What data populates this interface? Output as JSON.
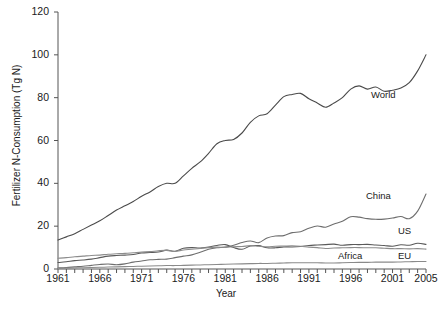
{
  "chart_data": {
    "type": "line",
    "title": "",
    "xlabel": "Year",
    "ylabel": "Fertilizer N-Consumption (Tg N)",
    "xlim": [
      1961,
      2005
    ],
    "ylim": [
      0,
      120
    ],
    "yticks": [
      0,
      20,
      40,
      60,
      80,
      100,
      120
    ],
    "xticks": [
      1961,
      1966,
      1971,
      1976,
      1981,
      1986,
      1991,
      1996,
      2001,
      2005
    ],
    "xtick_labels": [
      "1961",
      "1966",
      "1971",
      "1976",
      "1981",
      "1986",
      "1991",
      "1996",
      "2001",
      "2005"
    ],
    "ytick_labels": [
      "0",
      "20",
      "40",
      "60",
      "80",
      "100",
      "120"
    ],
    "grid": false,
    "legend": "inline-annotations",
    "x": [
      1961,
      1962,
      1963,
      1964,
      1965,
      1966,
      1967,
      1968,
      1969,
      1970,
      1971,
      1972,
      1973,
      1974,
      1975,
      1976,
      1977,
      1978,
      1979,
      1980,
      1981,
      1982,
      1983,
      1984,
      1985,
      1986,
      1987,
      1988,
      1989,
      1990,
      1991,
      1992,
      1993,
      1994,
      1995,
      1996,
      1997,
      1998,
      1999,
      2000,
      2001,
      2002,
      2003,
      2004,
      2005
    ],
    "series": [
      {
        "name": "World",
        "color": "#4a4a4a",
        "values": [
          13.5,
          15.0,
          16.5,
          18.5,
          20.5,
          22.5,
          25.0,
          27.5,
          29.5,
          31.5,
          34.0,
          36.0,
          38.5,
          40.0,
          40.0,
          43.5,
          47.0,
          50.0,
          54.0,
          58.5,
          60.0,
          60.5,
          63.5,
          68.5,
          71.5,
          72.5,
          76.5,
          80.5,
          81.5,
          82.0,
          79.5,
          77.5,
          75.5,
          77.5,
          80.0,
          84.0,
          85.5,
          84.0,
          85.0,
          83.0,
          83.5,
          84.5,
          87.0,
          92.5,
          100.0
        ]
      },
      {
        "name": "China",
        "color": "#6e6e6e",
        "values": [
          0.5,
          0.7,
          1.0,
          1.3,
          1.7,
          2.1,
          2.3,
          2.0,
          2.4,
          3.2,
          3.7,
          4.3,
          4.5,
          4.6,
          5.3,
          6.0,
          6.6,
          7.8,
          9.2,
          9.9,
          10.2,
          11.1,
          12.4,
          13.1,
          12.3,
          14.5,
          15.4,
          15.6,
          17.0,
          17.4,
          19.0,
          20.1,
          19.5,
          21.0,
          22.3,
          24.4,
          24.2,
          23.5,
          23.2,
          23.3,
          23.8,
          24.5,
          23.5,
          27.0,
          35.0
        ]
      },
      {
        "name": "US",
        "color": "#5a5a5a",
        "values": [
          3.0,
          3.4,
          3.9,
          4.2,
          4.6,
          5.3,
          6.0,
          6.3,
          6.5,
          6.8,
          7.5,
          7.7,
          7.9,
          8.8,
          8.3,
          9.7,
          10.0,
          9.8,
          10.3,
          11.0,
          11.4,
          10.0,
          9.2,
          10.7,
          10.9,
          9.9,
          9.9,
          10.3,
          10.3,
          10.5,
          11.0,
          11.2,
          11.4,
          11.6,
          11.1,
          11.4,
          11.4,
          11.5,
          11.2,
          11.0,
          10.6,
          11.3,
          11.1,
          12.0,
          11.5
        ]
      },
      {
        "name": "EU",
        "color": "#8c8c8c",
        "values": [
          5.0,
          5.3,
          5.7,
          6.0,
          6.3,
          6.5,
          6.9,
          7.1,
          7.3,
          7.6,
          7.9,
          8.1,
          8.5,
          8.7,
          8.2,
          8.9,
          9.2,
          9.6,
          10.0,
          10.2,
          10.1,
          10.4,
          10.5,
          10.9,
          10.6,
          10.4,
          10.6,
          10.7,
          10.8,
          10.6,
          10.2,
          10.0,
          9.6,
          9.8,
          9.9,
          10.0,
          10.0,
          9.9,
          9.9,
          9.7,
          9.5,
          9.5,
          9.4,
          9.5,
          9.3
        ]
      },
      {
        "name": "Africa",
        "color": "#8a8a8a",
        "values": [
          0.3,
          0.4,
          0.5,
          0.6,
          0.7,
          0.8,
          0.9,
          1.0,
          1.1,
          1.2,
          1.3,
          1.4,
          1.5,
          1.6,
          1.6,
          1.7,
          1.8,
          1.9,
          2.0,
          2.1,
          2.2,
          2.3,
          2.4,
          2.5,
          2.6,
          2.6,
          2.7,
          2.8,
          2.9,
          2.9,
          2.9,
          2.9,
          2.8,
          2.8,
          2.9,
          3.0,
          3.1,
          3.1,
          3.2,
          3.2,
          3.2,
          3.3,
          3.4,
          3.5,
          3.5
        ]
      }
    ],
    "annotations": [
      {
        "label": "World",
        "x_px": 371,
        "y_px": 89
      },
      {
        "label": "China",
        "x_px": 366,
        "y_px": 190
      },
      {
        "label": "US",
        "x_px": 398,
        "y_px": 225
      },
      {
        "label": "Africa",
        "x_px": 338,
        "y_px": 250
      },
      {
        "label": "EU",
        "x_px": 398,
        "y_px": 250
      }
    ]
  },
  "axes": {
    "ylabel": "Fertilizer N-Consumption (Tg N)",
    "xlabel": "Year"
  }
}
